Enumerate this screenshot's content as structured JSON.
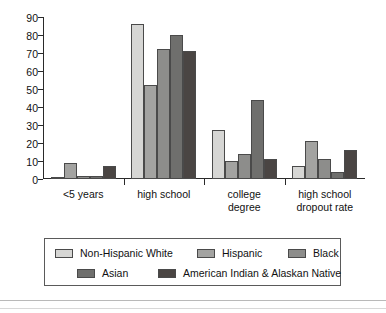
{
  "chart_data": {
    "type": "bar",
    "title": "",
    "xlabel": "",
    "ylabel": "",
    "ylim": [
      0,
      90
    ],
    "yticks": [
      0,
      10,
      20,
      30,
      40,
      50,
      60,
      70,
      80,
      90
    ],
    "grid": false,
    "legend_position": "bottom",
    "categories": [
      "<5 years",
      "high school",
      "college degree",
      "high school dropout rate"
    ],
    "category_lines": [
      [
        "<5 years"
      ],
      [
        "high school"
      ],
      [
        "college",
        "degree"
      ],
      [
        "high school",
        "dropout rate"
      ]
    ],
    "series": [
      {
        "name": "Non-Hispanic White",
        "color": "#d6d6d4",
        "values": [
          1,
          86,
          27,
          7
        ]
      },
      {
        "name": "Hispanic",
        "color": "#a3a3a1",
        "values": [
          9,
          52,
          10,
          21
        ]
      },
      {
        "name": "Black",
        "color": "#8d8d8b",
        "values": [
          1.5,
          72,
          14,
          11
        ]
      },
      {
        "name": "Asian",
        "color": "#6f6f6d",
        "values": [
          1.5,
          80,
          44,
          4
        ]
      },
      {
        "name": "American Indian & Alaskan Native",
        "color": "#4a4543",
        "values": [
          7,
          71,
          11,
          16
        ]
      }
    ]
  },
  "legend": {
    "entries": [
      "Non-Hispanic White",
      "Hispanic",
      "Black",
      "Asian",
      "American Indian & Alaskan Native"
    ]
  },
  "axis": {
    "ytick_labels": [
      "0",
      "10",
      "20",
      "30",
      "40",
      "50",
      "60",
      "70",
      "80",
      "90"
    ]
  }
}
